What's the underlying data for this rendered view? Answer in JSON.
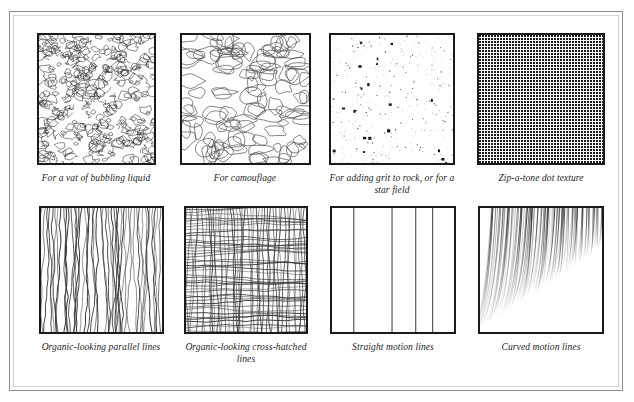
{
  "figure": {
    "frame_color": "#8d8d8d",
    "frame_inner_color": "#d2d2d2",
    "swatch_border_color": "#1a1a1a",
    "ink_color": "#1a1a1a",
    "background": "#ffffff"
  },
  "panels": [
    {
      "id": "bubbling-liquid",
      "caption": "For a vat of bubbling liquid",
      "texture": "dense-organic-blobs",
      "row": 1,
      "column": 1
    },
    {
      "id": "camouflage",
      "caption": "For camouflage",
      "texture": "large-organic-blobs",
      "row": 1,
      "column": 2
    },
    {
      "id": "grit-star-field",
      "caption": "For adding grit to rock, or for a star field",
      "texture": "random-speckle",
      "row": 1,
      "column": 3
    },
    {
      "id": "zip-a-tone",
      "caption": "Zip-a-tone dot texture",
      "texture": "regular-dot-grid",
      "row": 1,
      "column": 4
    },
    {
      "id": "organic-parallel",
      "caption": "Organic-looking parallel lines",
      "texture": "wavy-vertical-lines",
      "row": 2,
      "column": 1
    },
    {
      "id": "organic-crosshatch",
      "caption": "Organic-looking cross-hatched lines",
      "texture": "wavy-crosshatch",
      "row": 2,
      "column": 2
    },
    {
      "id": "straight-motion",
      "caption": "Straight motion lines",
      "texture": "vertical-speed-lines",
      "row": 2,
      "column": 3
    },
    {
      "id": "curved-motion",
      "caption": "Curved motion lines",
      "texture": "radiating-curved-lines",
      "row": 2,
      "column": 4
    }
  ]
}
